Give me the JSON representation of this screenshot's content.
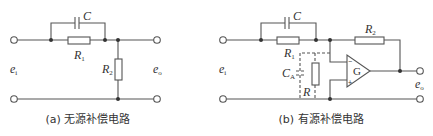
{
  "figure": {
    "panel_a": {
      "caption": "(a) 无源补偿电路",
      "labels": {
        "C": "C",
        "R1_main": "R",
        "R1_sub": "1",
        "R2_main": "R",
        "R2_sub": "2",
        "ei_main": "e",
        "ei_sub": "i",
        "eo_main": "e",
        "eo_sub": "o"
      }
    },
    "panel_b": {
      "caption": "(b) 有源补偿电路",
      "labels": {
        "C": "C",
        "R1_main": "R",
        "R1_sub": "1",
        "R2_main": "R",
        "R2_sub": "2",
        "CA_main": "C",
        "CA_sub": "A",
        "R": "R",
        "G": "G",
        "minus": "−",
        "plus": "+",
        "ei_main": "e",
        "ei_sub": "i",
        "eo_main": "e",
        "eo_sub": "o"
      }
    }
  }
}
